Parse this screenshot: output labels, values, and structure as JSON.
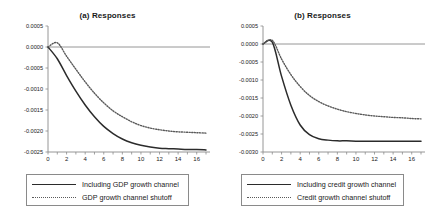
{
  "figure": {
    "background": "#ffffff",
    "axis_color": "#8a8a8a",
    "solid_color": "#2b2b2b",
    "dotted_color": "#5a5a5a"
  },
  "panels": [
    {
      "id": "a",
      "title": "(a) Responses",
      "legend": [
        {
          "label": "Including GDP growth channel",
          "style": "solid"
        },
        {
          "label": "GDP growth  channel shutoff",
          "style": "dotted"
        }
      ]
    },
    {
      "id": "b",
      "title": "(b) Responses",
      "legend": [
        {
          "label": "Including credit growth channel",
          "style": "solid"
        },
        {
          "label": "Credit growth channel shutoff",
          "style": "dotted"
        }
      ]
    }
  ],
  "chart_data": [
    {
      "type": "line",
      "title": "(a) Responses",
      "xlabel": "",
      "ylabel": "",
      "xlim": [
        0,
        17
      ],
      "ylim": [
        -0.0025,
        0.0005
      ],
      "xticks": [
        0,
        2,
        4,
        6,
        8,
        10,
        12,
        14,
        16
      ],
      "yticks": [
        0.0005,
        0.0,
        -0.0005,
        -0.001,
        -0.0015,
        -0.002,
        -0.0025
      ],
      "ytick_labels": [
        "0.0005",
        "0.0000",
        "-0.0005",
        "-0.0010",
        "-0.0015",
        "-0.0020",
        "-0.0025"
      ],
      "xtick_labels": [
        "0",
        "2",
        "4",
        "6",
        "8",
        "10",
        "12",
        "14",
        "16"
      ],
      "grid": false,
      "legend_position": "below",
      "x": [
        0,
        1,
        2,
        3,
        4,
        5,
        6,
        7,
        8,
        9,
        10,
        11,
        12,
        13,
        14,
        15,
        16,
        17
      ],
      "series": [
        {
          "name": "Including GDP growth channel",
          "style": "solid",
          "values": [
            0.0,
            -0.00028,
            -0.00068,
            -0.00105,
            -0.00138,
            -0.00166,
            -0.00189,
            -0.00206,
            -0.00219,
            -0.00228,
            -0.00234,
            -0.00238,
            -0.00241,
            -0.00242,
            -0.00243,
            -0.00244,
            -0.00244,
            -0.00245
          ]
        },
        {
          "name": "GDP growth  channel shutoff",
          "style": "dotted",
          "values": [
            0.0,
            0.0001,
            -0.00022,
            -0.00053,
            -0.00083,
            -0.0011,
            -0.00133,
            -0.00152,
            -0.00166,
            -0.00178,
            -0.00187,
            -0.00193,
            -0.00197,
            -0.002,
            -0.00202,
            -0.00203,
            -0.00204,
            -0.00205
          ]
        }
      ]
    },
    {
      "type": "line",
      "title": "(b) Responses",
      "xlabel": "",
      "ylabel": "",
      "xlim": [
        0,
        17
      ],
      "ylim": [
        -0.003,
        0.0005
      ],
      "xticks": [
        0,
        2,
        4,
        6,
        8,
        10,
        12,
        14,
        16
      ],
      "yticks": [
        0.0005,
        0.0,
        -0.0005,
        -0.001,
        -0.0015,
        -0.002,
        -0.0025,
        -0.003
      ],
      "ytick_labels": [
        "0.0005",
        "0.0000",
        "-0.0005",
        "-0.0010",
        "-0.0015",
        "-0.0020",
        "-0.0025",
        "-0.0030"
      ],
      "xtick_labels": [
        "0",
        "2",
        "4",
        "6",
        "8",
        "10",
        "12",
        "14",
        "16"
      ],
      "grid": false,
      "legend_position": "below",
      "x": [
        0,
        1,
        2,
        3,
        4,
        5,
        6,
        7,
        8,
        9,
        10,
        11,
        12,
        13,
        14,
        15,
        16,
        17
      ],
      "series": [
        {
          "name": "Including credit growth channel",
          "style": "solid",
          "values": [
            0.0,
            5e-05,
            -0.0009,
            -0.0017,
            -0.00225,
            -0.00252,
            -0.00263,
            -0.00267,
            -0.00269,
            -0.00269,
            -0.0027,
            -0.0027,
            -0.0027,
            -0.0027,
            -0.0027,
            -0.0027,
            -0.0027,
            -0.0027
          ]
        },
        {
          "name": "Credit growth channel shutoff",
          "style": "dotted",
          "values": [
            0.0,
            0.0001,
            -0.00042,
            -0.00085,
            -0.00118,
            -0.00143,
            -0.0016,
            -0.00172,
            -0.00181,
            -0.00188,
            -0.00193,
            -0.00197,
            -0.002,
            -0.00202,
            -0.00204,
            -0.00205,
            -0.00207,
            -0.00208
          ]
        }
      ]
    }
  ]
}
